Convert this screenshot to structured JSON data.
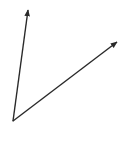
{
  "diagram": {
    "type": "angle",
    "stroke_color": "#2a2a2a",
    "background": "#ffffff",
    "vertex": {
      "x": 13,
      "y": 121
    },
    "rays": [
      {
        "name": "ray-up",
        "end": {
          "x": 28,
          "y": 10
        }
      },
      {
        "name": "ray-right",
        "end": {
          "x": 117,
          "y": 42
        }
      }
    ]
  }
}
